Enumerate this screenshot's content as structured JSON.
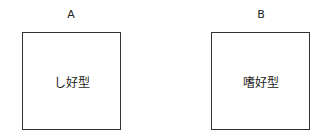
{
  "diagram": {
    "panels": [
      {
        "label": "A",
        "text": "し好型"
      },
      {
        "label": "B",
        "text": "嗜好型"
      }
    ]
  }
}
